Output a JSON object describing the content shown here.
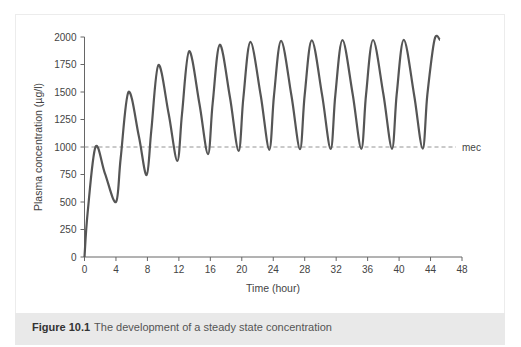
{
  "figure": {
    "caption_label": "Figure 10.1",
    "caption_text": "The development of a steady state concentration"
  },
  "colors": {
    "curve": "#555555",
    "axis": "#666666",
    "mec_line": "#888888",
    "caption_band": "#e9e9e9"
  },
  "chart_data": {
    "type": "line",
    "title": "",
    "xlabel": "Time (hour)",
    "ylabel": "Plasma concentration (µg/l)",
    "xlim": [
      0,
      48
    ],
    "ylim": [
      0,
      2000
    ],
    "x_ticks": [
      0,
      4,
      8,
      12,
      16,
      20,
      24,
      28,
      32,
      36,
      40,
      44,
      48
    ],
    "y_ticks": [
      0,
      250,
      500,
      750,
      1000,
      1250,
      1500,
      1750,
      2000
    ],
    "grid": false,
    "legend": null,
    "reference_line": {
      "y": 1000,
      "label": "mec",
      "style": "dashed"
    },
    "series": [
      {
        "name": "Plasma concentration",
        "x": [
          0,
          0.4,
          1.4,
          2.6,
          4.0,
          4.6,
          5.6,
          6.9,
          7.9,
          8.5,
          9.4,
          10.7,
          11.8,
          12.4,
          13.3,
          14.6,
          15.7,
          16.3,
          17.2,
          18.5,
          19.6,
          20.2,
          21.1,
          22.4,
          23.5,
          24.1,
          25.0,
          26.3,
          27.4,
          28.0,
          28.9,
          30.2,
          31.3,
          31.9,
          32.8,
          34.1,
          35.2,
          35.8,
          36.7,
          38.0,
          39.1,
          39.7,
          40.6,
          41.9,
          43.0,
          43.6,
          44.5,
          45.2
        ],
        "y": [
          0,
          400,
          1000,
          760,
          500,
          900,
          1500,
          1100,
          745,
          1150,
          1745,
          1300,
          875,
          1300,
          1870,
          1400,
          935,
          1400,
          1930,
          1450,
          965,
          1450,
          1955,
          1470,
          975,
          1470,
          1965,
          1475,
          980,
          1475,
          1970,
          1478,
          982,
          1478,
          1972,
          1480,
          983,
          1480,
          1973,
          1480,
          984,
          1480,
          1974,
          1480,
          985,
          1480,
          1975,
          1975
        ]
      }
    ]
  }
}
